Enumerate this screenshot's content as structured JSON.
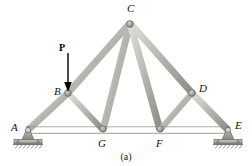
{
  "figure": {
    "caption": "(a)",
    "type": "statics-truss-diagram",
    "colors": {
      "member_fill": "#b9b9b4",
      "member_light": "#d8d8d4",
      "member_dark": "#8e8e88",
      "member_outline": "#6f6f69",
      "support_fill": "#a9a9a4",
      "ground_hatch": "#7a7a74",
      "label_color": "#111111",
      "arrow_color": "#000000",
      "background": "#ffffff"
    },
    "load": {
      "label": "P",
      "arrow_tail_x": 68,
      "arrow_tail_y": 52,
      "arrow_head_x": 68,
      "arrow_head_y": 90,
      "direction": "down",
      "applied_at_node": "B"
    },
    "nodes": [
      {
        "id": "A",
        "x": 28,
        "y": 130,
        "label": "A",
        "label_x": 14,
        "label_y": 124,
        "support": "pin"
      },
      {
        "id": "B",
        "x": 68,
        "y": 93,
        "label": "B",
        "label_x": 54,
        "label_y": 87,
        "support": "none"
      },
      {
        "id": "C",
        "x": 130,
        "y": 23,
        "label": "C",
        "label_x": 127,
        "label_y": 5,
        "support": "none"
      },
      {
        "id": "D",
        "x": 192,
        "y": 93,
        "label": "D",
        "label_x": 199,
        "label_y": 85,
        "support": "none"
      },
      {
        "id": "E",
        "x": 228,
        "y": 130,
        "label": "E",
        "label_x": 235,
        "label_y": 122,
        "support": "roller"
      },
      {
        "id": "F",
        "x": 160,
        "y": 130,
        "label": "F",
        "label_x": 157,
        "label_y": 139,
        "support": "none"
      },
      {
        "id": "G",
        "x": 103,
        "y": 130,
        "label": "G",
        "label_x": 99,
        "label_y": 139,
        "support": "none"
      }
    ],
    "members": [
      {
        "from": "A",
        "to": "B",
        "kind": "top-chord-left",
        "width": 7
      },
      {
        "from": "B",
        "to": "C",
        "kind": "top-chord-left",
        "width": 7
      },
      {
        "from": "C",
        "to": "D",
        "kind": "top-chord-right",
        "width": 7
      },
      {
        "from": "D",
        "to": "E",
        "kind": "top-chord-right",
        "width": 7
      },
      {
        "from": "A",
        "to": "G",
        "kind": "bottom-chord",
        "width": 7
      },
      {
        "from": "G",
        "to": "F",
        "kind": "bottom-chord",
        "width": 7
      },
      {
        "from": "F",
        "to": "E",
        "kind": "bottom-chord",
        "width": 7
      },
      {
        "from": "B",
        "to": "G",
        "kind": "web-diagonal",
        "width": 6
      },
      {
        "from": "C",
        "to": "G",
        "kind": "web-diagonal",
        "width": 7
      },
      {
        "from": "C",
        "to": "F",
        "kind": "web-diagonal",
        "width": 7
      },
      {
        "from": "D",
        "to": "F",
        "kind": "web-diagonal",
        "width": 6
      }
    ],
    "supports": {
      "pin": {
        "node": "A",
        "name": "pin-support",
        "description": "pinned support with hatched ground"
      },
      "roller": {
        "node": "E",
        "name": "roller-support",
        "description": "roller support with hatched ground"
      }
    }
  }
}
